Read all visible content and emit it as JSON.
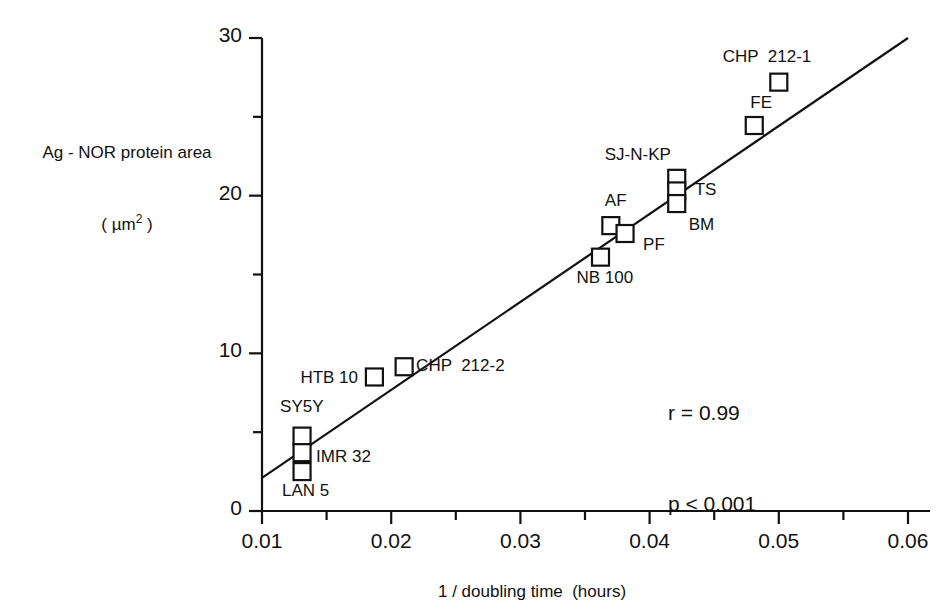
{
  "chart_data": {
    "type": "scatter",
    "title": "",
    "xlabel": "1 / doubling time  (hours)",
    "ylabel_line1": "Ag - NOR protein area",
    "ylabel_line2_pre": "( µm",
    "ylabel_line2_sup": "2",
    "ylabel_line2_post": " )",
    "xlim": [
      0.01,
      0.06
    ],
    "ylim": [
      0,
      30
    ],
    "xticks": [
      0.01,
      0.02,
      0.03,
      0.04,
      0.05,
      0.06
    ],
    "xtick_labels": [
      "0.01",
      "0.02",
      "0.03",
      "0.04",
      "0.05",
      "0.06"
    ],
    "xminor_ticks": [
      0.015,
      0.025,
      0.035,
      0.045,
      0.055
    ],
    "yticks": [
      0,
      10,
      20,
      30
    ],
    "ytick_labels": [
      "0",
      "10",
      "20",
      "30"
    ],
    "yminor_ticks": [
      5,
      15,
      25
    ],
    "grid": false,
    "legend": "none",
    "marker": "open-square",
    "points": [
      {
        "label": "SY5Y",
        "x": 0.0131,
        "y": 4.75,
        "label_dx": -22,
        "label_dy": -30,
        "label_align": "left"
      },
      {
        "label": "IMR 32",
        "x": 0.0131,
        "y": 3.7,
        "label_dx": 14,
        "label_dy": 3,
        "label_align": "left"
      },
      {
        "label": "LAN 5",
        "x": 0.0131,
        "y": 2.5,
        "label_dx": -20,
        "label_dy": 18,
        "label_align": "left"
      },
      {
        "label": "HTB 10",
        "x": 0.0187,
        "y": 8.5,
        "label_dx": -74,
        "label_dy": 0,
        "label_align": "left"
      },
      {
        "label": "CHP  212-2",
        "x": 0.021,
        "y": 9.15,
        "label_dx": 12,
        "label_dy": -2,
        "label_align": "left"
      },
      {
        "label": "NB 100",
        "x": 0.0362,
        "y": 16.1,
        "label_dx": -24,
        "label_dy": 20,
        "label_align": "left"
      },
      {
        "label": "AF",
        "x": 0.037,
        "y": 18.1,
        "label_dx": -6,
        "label_dy": -26,
        "label_align": "left"
      },
      {
        "label": "PF",
        "x": 0.0381,
        "y": 17.6,
        "label_dx": 18,
        "label_dy": 10,
        "label_align": "left"
      },
      {
        "label": "SJ-N-KP",
        "x": 0.0421,
        "y": 21.1,
        "label_dx": -72,
        "label_dy": -24,
        "label_align": "left"
      },
      {
        "label": "TS",
        "x": 0.0421,
        "y": 20.3,
        "label_dx": 18,
        "label_dy": -2,
        "label_align": "left"
      },
      {
        "label": "BM",
        "x": 0.0421,
        "y": 19.5,
        "label_dx": 12,
        "label_dy": 20,
        "label_align": "left"
      },
      {
        "label": "FE",
        "x": 0.0481,
        "y": 24.45,
        "label_dx": -4,
        "label_dy": -24,
        "label_align": "left"
      },
      {
        "label": "CHP  212-1",
        "x": 0.05,
        "y": 27.2,
        "label_dx": -56,
        "label_dy": -26,
        "label_align": "left"
      }
    ],
    "fit_line": {
      "x_start": 0.01,
      "y_start": 2.1,
      "x_end": 0.06,
      "y_end": 30.0
    },
    "annotations": {
      "r_text": "r = 0.99",
      "p_text": "p < 0.001",
      "r_value": 0.99,
      "p_value": "< 0.001"
    },
    "colors": {
      "axis": "#111111",
      "marker": "#111111",
      "line": "#111111"
    }
  }
}
